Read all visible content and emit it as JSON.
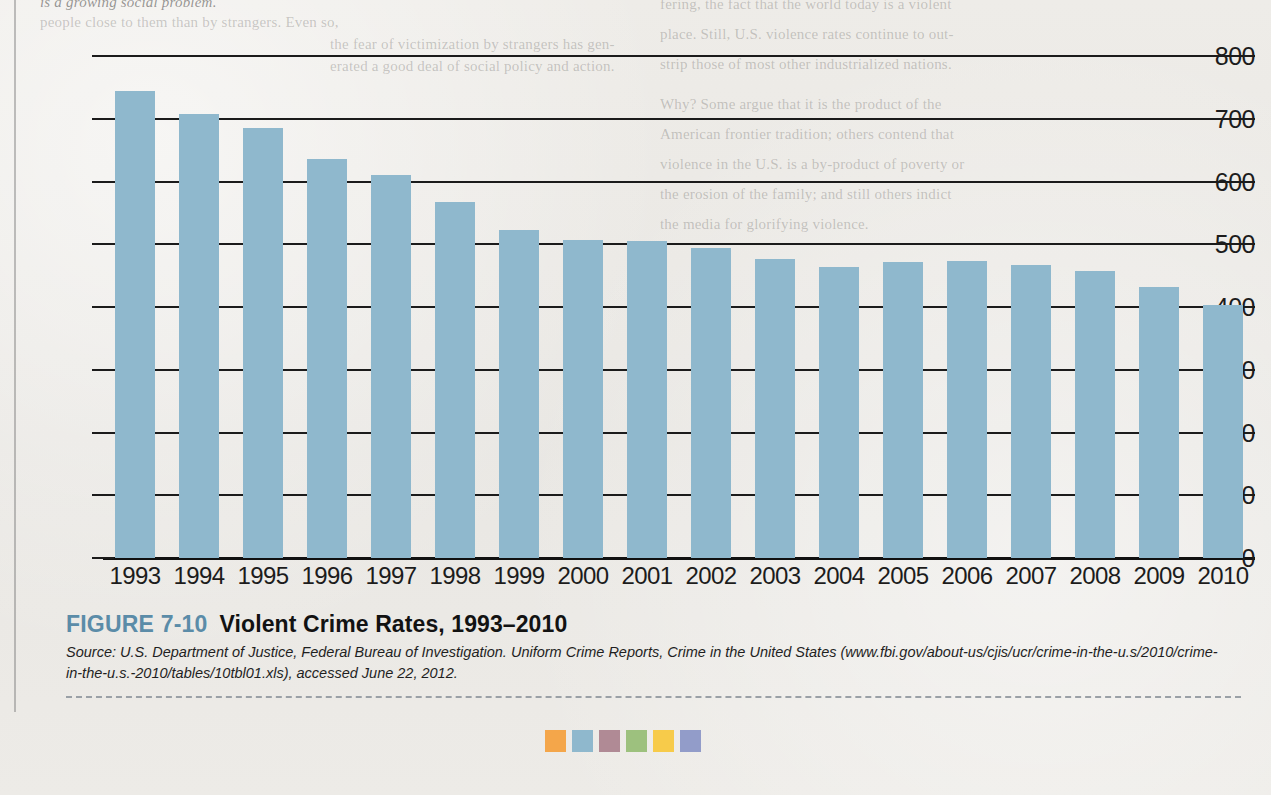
{
  "chart_data": {
    "type": "bar",
    "title": "Violent Crime Rates, 1993–2010",
    "xlabel": "",
    "ylabel": "",
    "ylim": [
      0,
      800
    ],
    "ytick_step": 100,
    "grid": true,
    "legend": "none",
    "bar_color": "#8fb8cd",
    "categories": [
      "1993",
      "1994",
      "1995",
      "1996",
      "1997",
      "1998",
      "1999",
      "2000",
      "2001",
      "2002",
      "2003",
      "2004",
      "2005",
      "2006",
      "2007",
      "2008",
      "2009",
      "2010"
    ],
    "values": [
      744,
      708,
      685,
      636,
      611,
      568,
      523,
      507,
      505,
      494,
      476,
      463,
      471,
      474,
      467,
      458,
      432,
      404
    ],
    "yticks": [
      "0",
      "100",
      "200",
      "300",
      "400",
      "500",
      "600",
      "700",
      "800"
    ]
  },
  "figure": {
    "number_label": "FIGURE 7-10",
    "title": "Violent Crime Rates, 1993–2010",
    "source_prefix": "Source:",
    "source_text_1": "U.S. Department of Justice, Federal Bureau of Investigation. Uniform Crime Reports,",
    "source_text_2": "Crime in the United States",
    "source_url": "(www.fbi.gov/about-us/cjis/ucr/crime-in-the-u.s/2010/crime-in-the-u.s.-2010/tables/10tbl01.xls),",
    "source_accessed": "accessed June 22, 2012.",
    "number_color": "#5b8ca8"
  },
  "swatches": [
    {
      "name": "swatch-orange",
      "color": "#f2a council"
    },
    {
      "name": "swatch-blue",
      "color": "#8fb8cd"
    },
    {
      "name": "swatch-mauve",
      "color": "#b08a95"
    },
    {
      "name": "swatch-green",
      "color": "#9dc17e"
    },
    {
      "name": "swatch-yellow",
      "color": "#f7cb4a"
    },
    {
      "name": "swatch-periwinkle",
      "color": "#929cc9"
    }
  ],
  "swatch_colors": [
    "#f4a64a",
    "#8fb8cd",
    "#b08a95",
    "#9dc17e",
    "#f7cb4a",
    "#929cc9"
  ],
  "ghost_page_text": {
    "top_line": "is a growing social problem.",
    "left_col": [
      "people close to them than by strangers. Even so,",
      "the fear of victimization by strangers has gen-",
      "erated a good deal of social policy and action."
    ],
    "right_col": [
      "fering, the fact that the world today is a violent",
      "place. Still, U.S. violence rates continue to out-",
      "strip those of most other industrialized nations.",
      "Why? Some argue that it is the product of the",
      "American frontier tradition; others contend that",
      "violence in the U.S. is a by-product of poverty or",
      "the erosion of the family; and still others indict",
      "the media for glorifying violence."
    ]
  }
}
